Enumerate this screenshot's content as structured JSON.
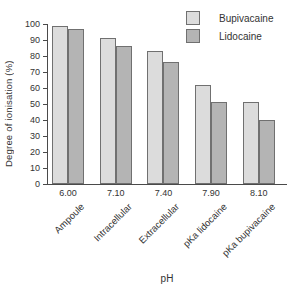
{
  "chart_data": {
    "type": "bar",
    "title": "",
    "xlabel": "pH",
    "ylabel": "Degree of ionisation (%)",
    "ylim": [
      0,
      100
    ],
    "ytick_step": 10,
    "grid": false,
    "legend_position": "top-right",
    "categories": [
      "Ampoule",
      "Intracellular",
      "Extracellular",
      "pKa lidocaine",
      "pKa bupivacaine"
    ],
    "x_tick_labels": [
      "6.00",
      "7.10",
      "7.40",
      "7.90",
      "8.10"
    ],
    "series": [
      {
        "name": "Bupivacaine",
        "color": "#dcdcdc",
        "values": [
          99,
          91,
          83,
          62,
          51
        ]
      },
      {
        "name": "Lidocaine",
        "color": "#b4b4b4",
        "values": [
          97,
          86,
          76,
          51,
          40
        ]
      }
    ],
    "colors": {
      "bar_border": "#707070",
      "axis": "#4a4a4a",
      "text": "#333333",
      "background": "#ffffff"
    }
  }
}
